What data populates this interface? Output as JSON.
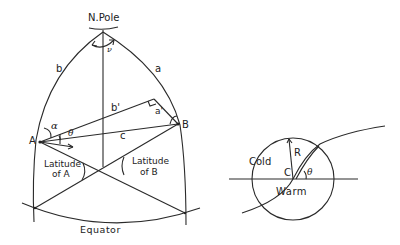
{
  "left_diagram": {
    "pole_label": "N.Pole",
    "arc_left_label": "b",
    "arc_right_label": "a",
    "pole_angle_label": "ν",
    "perpendicular_label": "b'",
    "segment_label": "a'",
    "chord_label": "c",
    "point_a_label": "A",
    "point_b_label": "B",
    "angle_alpha_label": "α",
    "angle_theta_label": "θ",
    "latitude_a_label_line1": "Latitude",
    "latitude_a_label_line2": "of A",
    "latitude_b_label_line1": "Latitude",
    "latitude_b_label_line2": "of B",
    "equator_label": "Equator"
  },
  "right_diagram": {
    "cold_label": "Cold",
    "warm_label": "Warm",
    "radius_label": "R",
    "center_label": "C",
    "angle_label": "θ"
  }
}
